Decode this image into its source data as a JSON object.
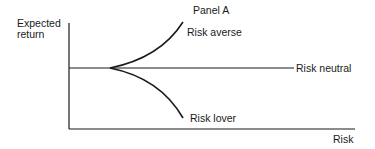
{
  "title": "Panel A",
  "y_axis_label_line1": "Expected",
  "y_axis_label_line2": "return",
  "x_axis_label": "Risk",
  "curves": {
    "averse": "Risk averse",
    "neutral": "Risk neutral",
    "lover": "Risk lover"
  },
  "colors": {
    "line": "#1a1a1a",
    "background": "#ffffff"
  }
}
